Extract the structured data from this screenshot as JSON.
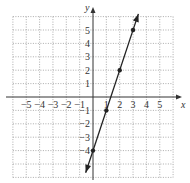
{
  "chart_data": {
    "type": "line",
    "title": "",
    "xlabel": "x",
    "ylabel": "y",
    "xlim": [
      -6,
      6
    ],
    "ylim": [
      -6,
      6
    ],
    "grid": true,
    "grid_style": "dotted",
    "x_ticks": [
      "-5",
      "-4",
      "-3",
      "-2",
      "-1",
      "1",
      "2",
      "3",
      "4",
      "5"
    ],
    "y_ticks": [
      "5",
      "4",
      "3",
      "2",
      "1",
      "-1",
      "-2",
      "-3",
      "-4"
    ],
    "series": [
      {
        "name": "y = 3x - 4",
        "equation": "y = 3x - 4",
        "points": [
          [
            0,
            -4
          ],
          [
            1,
            -1
          ],
          [
            2,
            2
          ],
          [
            3,
            5
          ]
        ],
        "arrows": "both",
        "color": "#222222"
      }
    ]
  }
}
